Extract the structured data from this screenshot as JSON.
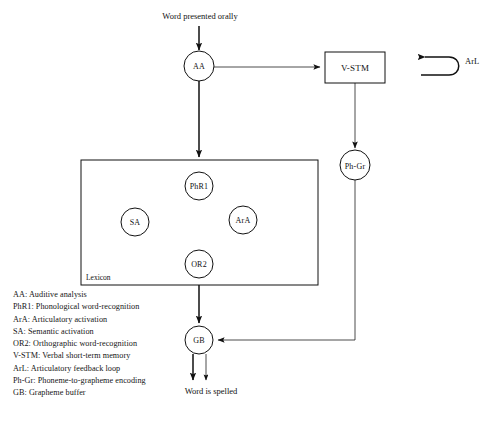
{
  "figure": {
    "title": "Word presented orally",
    "output_text": "Word is spelled",
    "lexicon_label": "Lexicon",
    "feedback_loop_label": "ArL"
  },
  "nodes": {
    "aa": {
      "label": "AA",
      "shape": "circle"
    },
    "vstm": {
      "label": "V-STM",
      "shape": "rectangle"
    },
    "phgr": {
      "label": "Ph-Gr",
      "shape": "circle"
    },
    "phr1": {
      "label": "PhR1",
      "shape": "circle"
    },
    "sa": {
      "label": "SA",
      "shape": "circle"
    },
    "ara": {
      "label": "ArA",
      "shape": "circle"
    },
    "or2": {
      "label": "OR2",
      "shape": "circle"
    },
    "gb": {
      "label": "GB",
      "shape": "circle"
    }
  },
  "legend": {
    "items": [
      "AA: Auditive analysis",
      "PhR1: Phonological word-recognition",
      "ArA: Articulatory activation",
      "SA: Semantic activation",
      "OR2: Orthographic word-recognition",
      "V-STM: Verbal short-term memory",
      "ArL: Articulatory feedback loop",
      "Ph-Gr: Phoneme-to-grapheme encoding",
      "GB: Grapheme buffer"
    ]
  },
  "caption": {
    "text": ""
  },
  "colors": {
    "stroke": "#111111",
    "background": "#ffffff",
    "text": "#151515"
  }
}
